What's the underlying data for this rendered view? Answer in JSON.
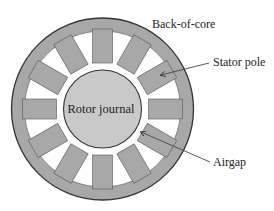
{
  "diagram": {
    "type": "stator-rotor-cross-section",
    "center": [
      102.5,
      109
    ],
    "outer_radius": 91,
    "back_core_inner_radius": 78,
    "pole_inner_radius": 46,
    "pole_width": 20,
    "rotor_radius": 39,
    "pole_count": 12,
    "pole_angle_step_deg": 30,
    "colors": {
      "stator": "#a8a8a8",
      "rotor": "#c9c9c9",
      "slot": "#ffffff",
      "outline": "#333333",
      "leader": "#444444"
    }
  },
  "labels": {
    "back_of_core": "Back-of-core",
    "stator_pole": "Stator pole",
    "rotor_journal": "Rotor journal",
    "airgap": "Airgap"
  }
}
